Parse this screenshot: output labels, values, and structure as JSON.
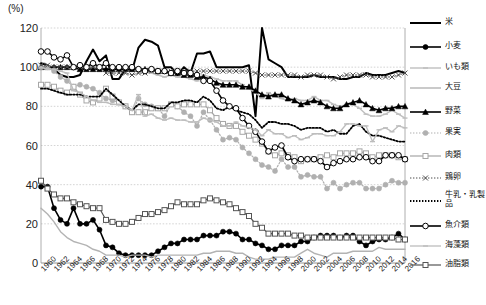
{
  "axis": {
    "unit_label": "(%)",
    "y_ticks": [
      0,
      20,
      40,
      60,
      80,
      100,
      120
    ],
    "y_min": 0,
    "y_max": 120,
    "x_ticks": [
      1960,
      1962,
      1964,
      1966,
      1968,
      1970,
      1972,
      1974,
      1976,
      1978,
      1980,
      1982,
      1984,
      1986,
      1988,
      1990,
      1992,
      1994,
      1996,
      1998,
      2000,
      2002,
      2004,
      2006,
      2008,
      2010,
      2012,
      2014,
      2016
    ]
  },
  "legend": {
    "items": [
      {
        "label": "米",
        "color": "#000000",
        "marker": "none",
        "dash": "solid",
        "width": 2.0
      },
      {
        "label": "小麦",
        "color": "#000000",
        "marker": "circle-solid",
        "dash": "solid",
        "width": 1.6
      },
      {
        "label": "いも類",
        "color": "#bfbfbf",
        "marker": "dash-mark",
        "dash": "solid",
        "width": 1.4
      },
      {
        "label": "大豆",
        "color": "#b3b3b3",
        "marker": "none",
        "dash": "solid",
        "width": 1.4
      },
      {
        "label": "野菜",
        "color": "#000000",
        "marker": "triangle",
        "dash": "solid",
        "width": 1.6
      },
      {
        "label": "果実",
        "color": "#b0b0b0",
        "marker": "circle-solid",
        "dash": "dotted",
        "width": 1.2
      },
      {
        "label": "肉類",
        "color": "#a6a6a6",
        "marker": "square-open",
        "dash": "solid",
        "width": 1.2
      },
      {
        "label": "鶏卵",
        "color": "#4d4d4d",
        "marker": "x",
        "dash": "dotted",
        "width": 1.0
      },
      {
        "label": "牛乳・乳製品",
        "color": "#000000",
        "marker": "none",
        "dash": "dotted",
        "width": 1.8
      },
      {
        "label": "魚介類",
        "color": "#000000",
        "marker": "circle-open",
        "dash": "solid",
        "width": 1.6
      },
      {
        "label": "海藻類",
        "color": "#bdbdbd",
        "marker": "dash-mark",
        "dash": "solid",
        "width": 1.3
      },
      {
        "label": "油脂類",
        "color": "#555555",
        "marker": "square-open",
        "dash": "solid",
        "width": 1.2
      }
    ]
  },
  "caption": "",
  "chart_data": {
    "type": "line",
    "title": "",
    "xlabel": "",
    "ylabel": "",
    "unit": "%",
    "ylim": [
      0,
      120
    ],
    "grid": true,
    "legend_position": "right",
    "x": [
      1960,
      1961,
      1962,
      1963,
      1964,
      1965,
      1966,
      1967,
      1968,
      1969,
      1970,
      1971,
      1972,
      1973,
      1974,
      1975,
      1976,
      1977,
      1978,
      1979,
      1980,
      1981,
      1982,
      1983,
      1984,
      1985,
      1986,
      1987,
      1988,
      1989,
      1990,
      1991,
      1992,
      1993,
      1994,
      1995,
      1996,
      1997,
      1998,
      1999,
      2000,
      2001,
      2002,
      2003,
      2004,
      2005,
      2006,
      2007,
      2008,
      2009,
      2010,
      2011,
      2012,
      2013,
      2014,
      2015,
      2016
    ],
    "series": [
      {
        "name": "米",
        "values": [
          102,
          101,
          99,
          96,
          95,
          95,
          96,
          103,
          109,
          103,
          106,
          94,
          94,
          99,
          98,
          110,
          114,
          113,
          111,
          100,
          100,
          96,
          100,
          97,
          107,
          107,
          108,
          100,
          100,
          100,
          100,
          100,
          101,
          75,
          120,
          104,
          102,
          100,
          95,
          95,
          95,
          95,
          96,
          95,
          95,
          95,
          94,
          94,
          95,
          95,
          97,
          96,
          96,
          96,
          97,
          98,
          97
        ]
      },
      {
        "name": "小麦",
        "values": [
          39,
          39,
          28,
          22,
          20,
          28,
          20,
          20,
          22,
          17,
          9,
          8,
          5,
          4,
          4,
          4,
          4,
          4,
          6,
          8,
          10,
          10,
          12,
          12,
          12,
          14,
          14,
          14,
          16,
          16,
          15,
          12,
          12,
          10,
          9,
          7,
          7,
          9,
          9,
          9,
          11,
          11,
          13,
          14,
          14,
          14,
          13,
          14,
          14,
          11,
          9,
          11,
          12,
          12,
          13,
          15,
          12
        ]
      },
      {
        "name": "いも類",
        "values": [
          100,
          100,
          100,
          100,
          100,
          100,
          99,
          100,
          100,
          100,
          99,
          99,
          99,
          98,
          98,
          99,
          98,
          97,
          96,
          95,
          96,
          95,
          95,
          94,
          93,
          96,
          95,
          94,
          93,
          93,
          93,
          91,
          89,
          87,
          84,
          87,
          85,
          84,
          83,
          84,
          83,
          83,
          85,
          83,
          83,
          81,
          80,
          81,
          81,
          79,
          76,
          75,
          75,
          76,
          78,
          76,
          74
        ]
      },
      {
        "name": "大豆",
        "values": [
          28,
          25,
          21,
          16,
          13,
          11,
          10,
          9,
          7,
          6,
          4,
          4,
          4,
          3,
          4,
          4,
          4,
          3,
          4,
          4,
          4,
          4,
          4,
          4,
          4,
          5,
          5,
          6,
          6,
          6,
          5,
          5,
          3,
          2,
          2,
          2,
          3,
          3,
          3,
          3,
          5,
          7,
          5,
          4,
          3,
          5,
          5,
          5,
          6,
          6,
          6,
          6,
          8,
          7,
          7,
          7,
          7
        ]
      },
      {
        "name": "野菜",
        "values": [
          100,
          100,
          100,
          100,
          100,
          100,
          99,
          99,
          99,
          99,
          99,
          99,
          99,
          99,
          99,
          99,
          99,
          99,
          98,
          98,
          97,
          97,
          96,
          96,
          95,
          95,
          94,
          92,
          91,
          91,
          91,
          90,
          90,
          88,
          86,
          85,
          86,
          86,
          84,
          83,
          81,
          82,
          83,
          82,
          80,
          79,
          79,
          81,
          82,
          83,
          81,
          79,
          78,
          79,
          79,
          80,
          80
        ]
      },
      {
        "name": "果実",
        "values": [
          100,
          100,
          98,
          95,
          93,
          90,
          91,
          90,
          89,
          87,
          84,
          83,
          82,
          80,
          77,
          84,
          81,
          80,
          79,
          75,
          81,
          80,
          77,
          75,
          70,
          77,
          73,
          68,
          63,
          64,
          63,
          59,
          56,
          53,
          50,
          49,
          47,
          53,
          49,
          49,
          44,
          45,
          44,
          44,
          38,
          41,
          38,
          40,
          41,
          41,
          38,
          38,
          38,
          40,
          42,
          41,
          41
        ]
      },
      {
        "name": "肉類",
        "values": [
          91,
          91,
          90,
          88,
          87,
          90,
          86,
          83,
          82,
          84,
          89,
          85,
          82,
          80,
          77,
          77,
          77,
          79,
          79,
          79,
          81,
          80,
          81,
          81,
          81,
          81,
          78,
          74,
          71,
          70,
          70,
          67,
          65,
          63,
          61,
          57,
          55,
          56,
          55,
          54,
          52,
          53,
          53,
          54,
          55,
          54,
          56,
          56,
          56,
          57,
          56,
          54,
          55,
          55,
          55,
          54,
          53
        ]
      },
      {
        "name": "鶏卵",
        "values": [
          101,
          101,
          100,
          100,
          100,
          100,
          100,
          100,
          100,
          100,
          97,
          97,
          97,
          97,
          96,
          97,
          97,
          98,
          98,
          98,
          98,
          98,
          98,
          98,
          98,
          98,
          98,
          98,
          98,
          98,
          98,
          98,
          98,
          97,
          96,
          96,
          96,
          96,
          96,
          96,
          95,
          96,
          96,
          96,
          95,
          94,
          95,
          96,
          96,
          96,
          96,
          95,
          95,
          95,
          95,
          96,
          97
        ]
      },
      {
        "name": "牛乳・乳製品",
        "values": [
          89,
          89,
          88,
          87,
          86,
          86,
          86,
          85,
          85,
          85,
          89,
          86,
          83,
          80,
          78,
          81,
          81,
          80,
          79,
          79,
          82,
          82,
          83,
          83,
          82,
          85,
          83,
          79,
          78,
          80,
          78,
          77,
          76,
          73,
          69,
          72,
          72,
          71,
          71,
          70,
          68,
          69,
          69,
          69,
          67,
          68,
          66,
          66,
          70,
          71,
          67,
          65,
          65,
          64,
          63,
          62,
          62
        ]
      },
      {
        "name": "魚介類",
        "values": [
          108,
          108,
          105,
          104,
          106,
          100,
          101,
          100,
          102,
          100,
          102,
          100,
          100,
          100,
          100,
          99,
          98,
          99,
          98,
          98,
          97,
          98,
          97,
          97,
          96,
          93,
          93,
          88,
          83,
          80,
          79,
          74,
          70,
          67,
          62,
          57,
          59,
          60,
          54,
          52,
          53,
          53,
          53,
          52,
          49,
          51,
          52,
          53,
          53,
          54,
          54,
          52,
          52,
          55,
          55,
          55,
          53
        ]
      },
      {
        "name": "海藻類",
        "values": [
          100,
          99,
          99,
          98,
          97,
          88,
          87,
          85,
          83,
          82,
          82,
          81,
          81,
          80,
          78,
          86,
          75,
          76,
          74,
          73,
          74,
          73,
          73,
          72,
          72,
          74,
          73,
          72,
          70,
          70,
          72,
          70,
          69,
          68,
          65,
          68,
          66,
          66,
          64,
          65,
          63,
          64,
          66,
          66,
          65,
          65,
          67,
          71,
          71,
          70,
          70,
          62,
          68,
          69,
          67,
          70,
          69
        ]
      },
      {
        "name": "油脂類",
        "values": [
          42,
          38,
          35,
          33,
          33,
          31,
          30,
          29,
          28,
          28,
          22,
          21,
          20,
          20,
          21,
          23,
          25,
          25,
          26,
          27,
          29,
          31,
          30,
          30,
          30,
          32,
          33,
          32,
          31,
          30,
          28,
          26,
          24,
          20,
          18,
          15,
          15,
          15,
          15,
          14,
          14,
          13,
          13,
          13,
          13,
          13,
          13,
          13,
          13,
          13,
          13,
          13,
          13,
          13,
          13,
          12,
          12
        ]
      }
    ]
  }
}
